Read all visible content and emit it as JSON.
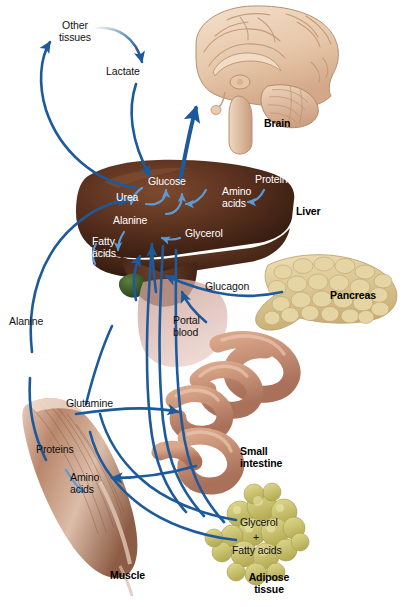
{
  "figure": {
    "type": "biological-pathway-diagram",
    "background_color": "#ffffff",
    "arrow_color": "#1d5a9c",
    "arrow_color_light": "#5b9bd5"
  },
  "organs": [
    {
      "id": "brain",
      "label": "Brain",
      "color": "#e8c9ae"
    },
    {
      "id": "liver",
      "label": "Liver",
      "color": "#4a2a1c"
    },
    {
      "id": "pancreas",
      "label": "Pancreas",
      "color": "#ddc68f"
    },
    {
      "id": "intestine",
      "label": "Small\nintestine",
      "color": "#c08a6e"
    },
    {
      "id": "muscle",
      "label": "Muscle",
      "color": "#a9765c"
    },
    {
      "id": "adipose",
      "label": "Adipose\ntissue",
      "color": "#cfc970"
    }
  ],
  "labels": {
    "other_tissues": "Other\ntissues",
    "lactate": "Lactate",
    "glucose": "Glucose",
    "urea": "Urea",
    "alanine_liver": "Alanine",
    "fatty_acids_liver": "Fatty\nacids",
    "ketone_bodies": "Ketone\nbodies",
    "glycerol_liver": "Glycerol",
    "amino_acids_liver": "Amino\nacids",
    "protein_liver": "Protein",
    "liver_name": "Liver",
    "brain_name": "Brain",
    "pancreas_name": "Pancreas",
    "glucagon": "Glucagon",
    "portal_blood": "Portal\nblood",
    "intestine_name": "Small\nintestine",
    "alanine_left": "Alanine",
    "glutamine": "Glutamine",
    "proteins_muscle": "Proteins",
    "amino_acids_muscle": "Amino\nacids",
    "muscle_name": "Muscle",
    "glycerol_adipose": "Glycerol",
    "plus_sign": "+",
    "fatty_acids_adipose": "Fatty acids",
    "adipose_name": "Adipose\ntissue"
  }
}
